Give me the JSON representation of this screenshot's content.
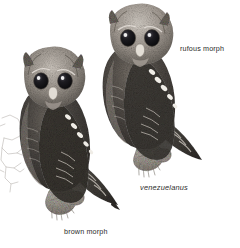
{
  "plate": {
    "kind": "field-guide-illustration-plate",
    "background_color": "#ffffff",
    "ink_color": "#2b2b2b",
    "medium": "grayscale stippled pen-and-ink / graphite",
    "subject": "screech-owl plumage morphs"
  },
  "labels": {
    "rufous_morph": "rufous morph",
    "brown_morph": "brown morph",
    "subspecies": "venezuelanus"
  },
  "figures": {
    "rufous": {
      "name": "rufous morph owl",
      "position": "upper right",
      "posture": "perched, body in profile facing left, head turned forward",
      "features": [
        "rounded head with short ear tufts",
        "large dark forward-facing eyes",
        "pale bill",
        "diagonal row of white scapular spots",
        "barred wing coverts",
        "barred tail tip",
        "feathered feet gripping branch stub"
      ]
    },
    "brown": {
      "name": "brown morph owl",
      "position": "lower left",
      "posture": "perched, body in profile facing right, head turned forward",
      "features": [
        "rounded head with short ear tufts",
        "large dark forward-facing eyes",
        "pale bill",
        "diagonal row of white scapular spots",
        "barred wing coverts and tail",
        "feathered feet gripping branch stub"
      ]
    },
    "sketch": {
      "name": "unfinished pencil sketch",
      "position": "left edge",
      "description": "faint incomplete outline study"
    }
  },
  "colors": {
    "ink": "#2b2b2b",
    "paper": "#ffffff",
    "plumage_dark": "#3a3734",
    "plumage_mid": "#7b756e",
    "plumage_light": "#b9b3ab",
    "highlight": "#f2efea",
    "eye": "#17161a"
  }
}
